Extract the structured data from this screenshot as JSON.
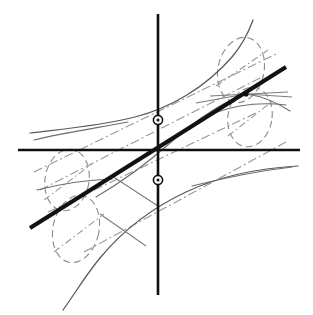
{
  "figure": {
    "title": "Hand-drawn projective geometry diagram",
    "background_color": "#ffffff",
    "width": 313,
    "height": 315
  },
  "colors": {
    "axis": "#0f0f10",
    "chord": "#121214",
    "curve": "#6d6d72",
    "dashed_ellipse": "#8a8a90",
    "dash_dot_ray": "#96969c",
    "marker_stroke": "#101012",
    "marker_fill": "#ffffff"
  },
  "axes": {
    "horizontal": {
      "name": "x-axis",
      "x1": 18,
      "y1": 150,
      "x2": 300,
      "y2": 150
    },
    "vertical": {
      "name": "y-axis",
      "x1": 158,
      "y1": 14,
      "x2": 158,
      "y2": 295
    },
    "origin": {
      "x": 158,
      "y": 150
    }
  },
  "chord": {
    "name": "secant-line",
    "x1": 30,
    "y1": 228,
    "x2": 286,
    "y2": 67,
    "slope_note": "passes through the origin rising to the right"
  },
  "markers": [
    {
      "name": "upper-axis-point",
      "x": 158,
      "y": 120,
      "radius": 4.6
    },
    {
      "name": "lower-axis-point",
      "x": 158,
      "y": 180,
      "radius": 4.6
    }
  ],
  "node": {
    "name": "tangency-node",
    "x": 246,
    "y": 94
  },
  "curves": [
    {
      "name": "upper-branch-curve",
      "path": "M 30 133 C 62 129, 100 126, 135 117 C 170 108, 205 88, 232 57 C 243 44, 249 31, 253 20"
    },
    {
      "name": "lower-branch-curve",
      "path": "M 63 310 C 74 295, 85 276, 100 258 C 124 229, 152 208, 186 192 C 222 175, 262 168, 298 166"
    },
    {
      "name": "inner-upper-curve",
      "path": "M 96 197 C 120 183, 144 166, 170 143 C 196 120, 222 102, 246 94"
    },
    {
      "name": "inner-lower-curve",
      "path": "M 246 94 C 262 96, 276 102, 290 111"
    },
    {
      "name": "left-flat-curve",
      "path": "M 34 140 C 62 133, 96 128, 128 122"
    },
    {
      "name": "lower-right-flat-curve",
      "path": "M 192 186 C 224 178, 258 171, 292 167"
    },
    {
      "name": "left-small-arc",
      "path": "M 37 190 C 60 184, 86 180, 112 179"
    },
    {
      "name": "right-small-arc",
      "path": "M 214 113 C 236 105, 262 102, 286 105"
    }
  ],
  "ellipses": [
    {
      "name": "upper-right-ellipse",
      "cx": 241,
      "cy": 70,
      "rx": 23,
      "ry": 33,
      "rotate": 12
    },
    {
      "name": "lower-right-ellipse",
      "cx": 250,
      "cy": 117,
      "rx": 22,
      "ry": 30,
      "rotate": 10
    },
    {
      "name": "upper-left-ellipse",
      "cx": 67,
      "cy": 180,
      "rx": 22,
      "ry": 31,
      "rotate": 10
    },
    {
      "name": "lower-left-ellipse",
      "cx": 76,
      "cy": 229,
      "rx": 23,
      "ry": 34,
      "rotate": 12
    }
  ],
  "rays": [
    {
      "name": "ray-upper-outer",
      "x1": 34,
      "y1": 172,
      "x2": 276,
      "y2": 54
    },
    {
      "name": "ray-upper-inner",
      "x1": 40,
      "y1": 190,
      "x2": 264,
      "y2": 76
    },
    {
      "name": "ray-lower-inner",
      "x1": 48,
      "y1": 212,
      "x2": 258,
      "y2": 112
    },
    {
      "name": "ray-lower-outer",
      "x1": 84,
      "y1": 252,
      "x2": 286,
      "y2": 142
    },
    {
      "name": "ray-ellipse-axis-right-upper",
      "x1": 216,
      "y1": 86,
      "x2": 268,
      "y2": 50
    },
    {
      "name": "ray-ellipse-axis-right-lower",
      "x1": 228,
      "y1": 136,
      "x2": 274,
      "y2": 100
    },
    {
      "name": "ray-ellipse-axis-left-upper",
      "x1": 44,
      "y1": 200,
      "x2": 92,
      "y2": 164
    },
    {
      "name": "ray-ellipse-axis-left-lower",
      "x1": 54,
      "y1": 252,
      "x2": 104,
      "y2": 214
    }
  ],
  "tangents": [
    {
      "name": "node-tangent-left",
      "x1": 196,
      "y1": 103,
      "x2": 246,
      "y2": 94
    },
    {
      "name": "node-tangent-right",
      "x1": 246,
      "y1": 94,
      "x2": 292,
      "y2": 97
    },
    {
      "name": "node-tangent-flat",
      "x1": 210,
      "y1": 96,
      "x2": 288,
      "y2": 92
    },
    {
      "name": "crossing-left-upper",
      "x1": 112,
      "y1": 176,
      "x2": 158,
      "y2": 206
    },
    {
      "name": "crossing-left-lower",
      "x1": 100,
      "y1": 214,
      "x2": 146,
      "y2": 246
    }
  ]
}
